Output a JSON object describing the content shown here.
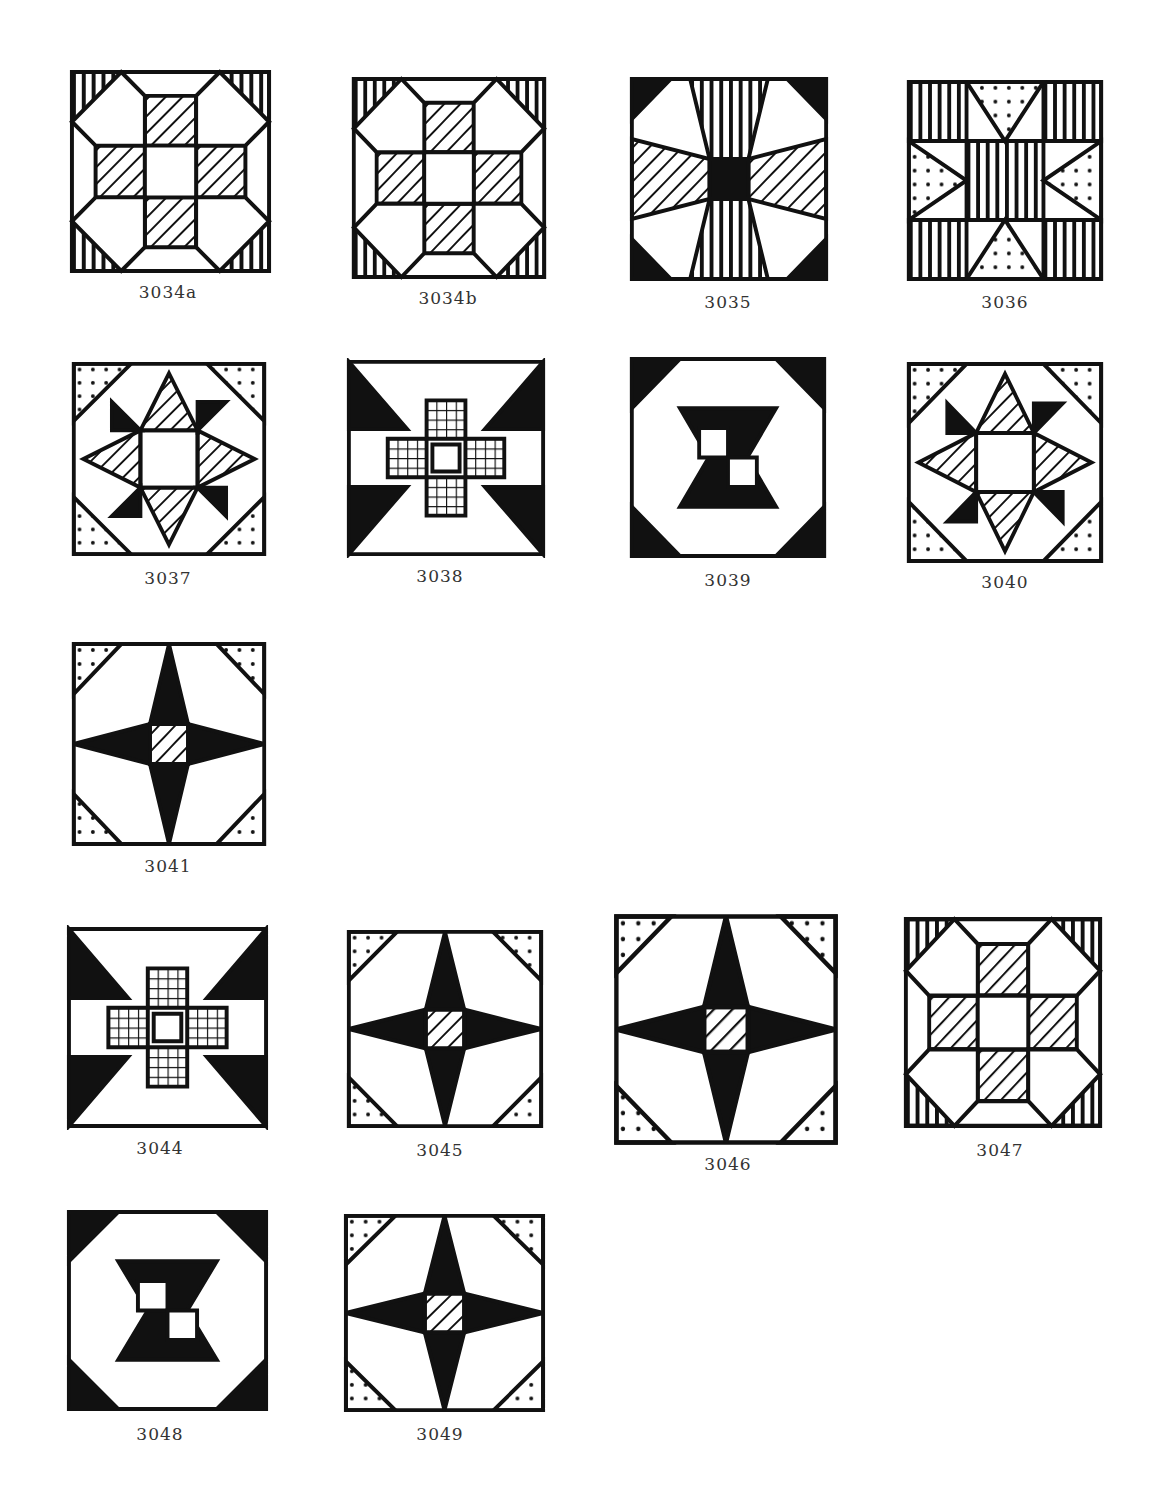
{
  "page": {
    "background": "#ffffff",
    "ink": "#111111"
  },
  "blocks": [
    {
      "id": "3034a",
      "label": "3034a",
      "x": 68,
      "y": 68,
      "w": 205,
      "h": 207,
      "lx": 68,
      "ly": 282,
      "pattern": "star-eight-point"
    },
    {
      "id": "3034b",
      "label": "3034b",
      "x": 350,
      "y": 75,
      "w": 198,
      "h": 206,
      "lx": 348,
      "ly": 288,
      "pattern": "star-eight-point"
    },
    {
      "id": "3035",
      "label": "3035",
      "x": 628,
      "y": 75,
      "w": 202,
      "h": 208,
      "lx": 628,
      "ly": 292,
      "pattern": "flower-cross"
    },
    {
      "id": "3036",
      "label": "3036",
      "x": 905,
      "y": 78,
      "w": 200,
      "h": 205,
      "lx": 905,
      "ly": 292,
      "pattern": "square-star"
    },
    {
      "id": "3037",
      "label": "3037",
      "x": 70,
      "y": 360,
      "w": 198,
      "h": 198,
      "lx": 68,
      "ly": 568,
      "pattern": "star-ring"
    },
    {
      "id": "3038",
      "label": "3038",
      "x": 345,
      "y": 358,
      "w": 202,
      "h": 200,
      "lx": 340,
      "ly": 566,
      "pattern": "star-cross"
    },
    {
      "id": "3039",
      "label": "3039",
      "x": 628,
      "y": 355,
      "w": 200,
      "h": 205,
      "lx": 628,
      "ly": 570,
      "pattern": "nine-patch-star"
    },
    {
      "id": "3040",
      "label": "3040",
      "x": 905,
      "y": 360,
      "w": 200,
      "h": 205,
      "lx": 905,
      "ly": 572,
      "pattern": "star-ring"
    },
    {
      "id": "3041",
      "label": "3041",
      "x": 70,
      "y": 640,
      "w": 198,
      "h": 208,
      "lx": 68,
      "ly": 856,
      "pattern": "compass-star"
    },
    {
      "id": "3044",
      "label": "3044",
      "x": 65,
      "y": 925,
      "w": 205,
      "h": 205,
      "lx": 60,
      "ly": 1138,
      "pattern": "star-cross"
    },
    {
      "id": "3045",
      "label": "3045",
      "x": 345,
      "y": 928,
      "w": 200,
      "h": 202,
      "lx": 340,
      "ly": 1140,
      "pattern": "compass-star"
    },
    {
      "id": "3046",
      "label": "3046",
      "x": 612,
      "y": 912,
      "w": 228,
      "h": 235,
      "lx": 628,
      "ly": 1154,
      "pattern": "compass-star"
    },
    {
      "id": "3047",
      "label": "3047",
      "x": 902,
      "y": 915,
      "w": 202,
      "h": 215,
      "lx": 900,
      "ly": 1140,
      "pattern": "star-eight-point"
    },
    {
      "id": "3048",
      "label": "3048",
      "x": 65,
      "y": 1208,
      "w": 205,
      "h": 205,
      "lx": 60,
      "ly": 1424,
      "pattern": "nine-patch-star"
    },
    {
      "id": "3049",
      "label": "3049",
      "x": 342,
      "y": 1212,
      "w": 205,
      "h": 202,
      "lx": 340,
      "ly": 1424,
      "pattern": "compass-star"
    }
  ]
}
